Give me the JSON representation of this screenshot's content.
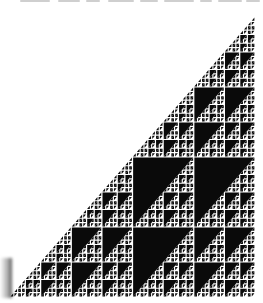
{
  "image": {
    "description": "Self-similar right-triangle fractal (Sierpinski-like cellular automaton pattern), black on white",
    "background_color": "#ffffff",
    "ink_color": "#0a0a0a",
    "gap_color": "#ffffff"
  },
  "fractal": {
    "bounds": {
      "x": 10,
      "y": 17,
      "width": 245,
      "height": 280
    },
    "orientation": "right-angle-at-bottom-right",
    "max_depth": 6,
    "gap_px": 0.6,
    "rules": {
      "triangle": "top-right half triangle + bottom-left half triangle + bottom-right square",
      "square": "2x2 quadrants: top-left, top-right, bottom-left are quads; bottom-right is a square",
      "quad": "solid upper-left triangle + triangle in lower-right half"
    }
  },
  "top_text_fragment": {
    "note": "Only the bottom pixels of a cut-off text line are visible; unreadable",
    "segments": [
      [
        20,
        30
      ],
      [
        58,
        22
      ],
      [
        86,
        14
      ],
      [
        108,
        26
      ],
      [
        140,
        18
      ],
      [
        164,
        30
      ],
      [
        200,
        12
      ],
      [
        218,
        24
      ],
      [
        246,
        14
      ]
    ]
  }
}
